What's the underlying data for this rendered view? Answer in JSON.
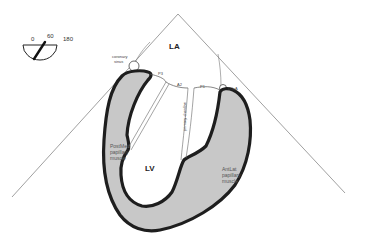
{
  "diagram": {
    "type": "echocardiography-view-schematic",
    "colors": {
      "background": "#ffffff",
      "myocardium_fill": "#c8c8c8",
      "myocardium_outline": "#1e1e1e",
      "sector_line": "#666666",
      "label_text": "#333333"
    },
    "angle_indicator": {
      "labels": [
        "0",
        "60",
        "180"
      ],
      "current_angle": "60"
    },
    "chambers": {
      "left_atrium": "LA",
      "left_ventricle": "LV"
    },
    "mitral_scallops": {
      "p3": "P3",
      "a2": "A2",
      "p1": "P1"
    },
    "structures": {
      "coronary_sinus": [
        "coronary",
        "sinus"
      ],
      "lcx": "LCxA",
      "primary_chordae": "primary chordae",
      "postmed_papillary": [
        "PostMed",
        "papillary",
        "muscle"
      ],
      "antlat_papillary": [
        "AntLat",
        "papillary",
        "muscle"
      ]
    }
  }
}
